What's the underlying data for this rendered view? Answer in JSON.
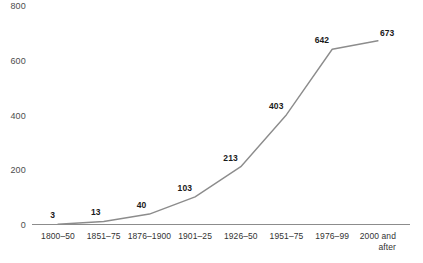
{
  "chart_data": {
    "type": "line",
    "title": "",
    "subtitle": "",
    "xlabel": "",
    "ylabel": "",
    "categories": [
      "1800–50",
      "1851–75",
      "1876–1900",
      "1901–25",
      "1926–50",
      "1951–75",
      "1976–99",
      "2000 and after"
    ],
    "values": [
      3,
      13,
      40,
      103,
      213,
      403,
      642,
      673
    ],
    "data_labels": [
      "3",
      "13",
      "40",
      "103",
      "213",
      "403",
      "642",
      "673"
    ],
    "yticks": [
      "0",
      "200",
      "400",
      "600",
      "800"
    ],
    "ytick_values": [
      0,
      200,
      400,
      600,
      800
    ],
    "ylim": [
      0,
      800
    ],
    "grid": false,
    "legend": false,
    "legend_position": "none",
    "series": [
      {
        "name": "",
        "values": [
          3,
          13,
          40,
          103,
          213,
          403,
          642,
          673
        ]
      }
    ],
    "colors": {
      "line": "#8c8c8c",
      "axis": "#8c8c8c",
      "data_label": "#1a1a1a",
      "tick_label": "#4d4d4d",
      "background": "#ffffff"
    }
  },
  "xaxis": {
    "labels": [
      {
        "line1": "1800–50",
        "line2": ""
      },
      {
        "line1": "1851–75",
        "line2": ""
      },
      {
        "line1": "1876–1900",
        "line2": ""
      },
      {
        "line1": "1901–25",
        "line2": ""
      },
      {
        "line1": "1926–50",
        "line2": ""
      },
      {
        "line1": "1951–75",
        "line2": ""
      },
      {
        "line1": "1976–99",
        "line2": ""
      },
      {
        "line1": "2000 and",
        "line2": "after"
      }
    ]
  }
}
